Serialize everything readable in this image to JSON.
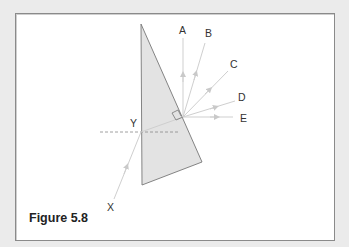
{
  "figure": {
    "caption": "Figure 5.8",
    "colors": {
      "background": "#ebebeb",
      "frame_border": "#8a8a8a",
      "prism_fill": "#e3e3e3",
      "prism_stroke": "#777777",
      "ray": "#cfcfcf",
      "dashed_line": "#888888",
      "label": "#333333"
    },
    "labels": {
      "A": "A",
      "B": "B",
      "C": "C",
      "D": "D",
      "E": "E",
      "X": "X",
      "Y": "Y"
    },
    "elements": {
      "prism": "triangular prism cross-section",
      "normal_line": "dashed normal line at Y",
      "right_angle_marker": "right-angle marker at exit point",
      "incident_ray": "ray X entering at Y",
      "emergent_rays": [
        "A",
        "B",
        "C",
        "D",
        "E"
      ]
    }
  }
}
